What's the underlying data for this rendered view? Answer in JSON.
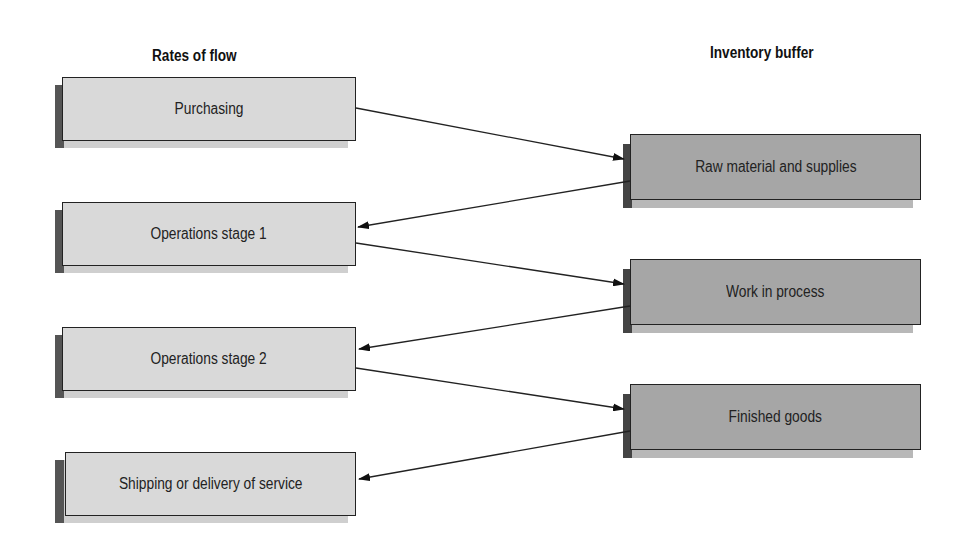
{
  "headers": {
    "left": "Rates of flow",
    "right": "Inventory buffer"
  },
  "rates_of_flow": [
    {
      "label": "Purchasing"
    },
    {
      "label": "Operations stage 1"
    },
    {
      "label": "Operations stage 2"
    },
    {
      "label": "Shipping or delivery of service"
    }
  ],
  "inventory_buffers": [
    {
      "label": "Raw material and supplies"
    },
    {
      "label": "Work in process"
    },
    {
      "label": "Finished goods"
    }
  ],
  "flows": [
    {
      "from": "Purchasing",
      "to": "Raw material and supplies"
    },
    {
      "from": "Raw material and supplies",
      "to": "Operations stage 1"
    },
    {
      "from": "Operations stage 1",
      "to": "Work in process"
    },
    {
      "from": "Work in process",
      "to": "Operations stage 2"
    },
    {
      "from": "Operations stage 2",
      "to": "Finished goods"
    },
    {
      "from": "Finished goods",
      "to": "Shipping or delivery of service"
    }
  ],
  "colors": {
    "flow_box_fill": "#d9d9d9",
    "buffer_box_fill": "#a6a6a6",
    "border": "#222222",
    "shadow": "#777777"
  }
}
